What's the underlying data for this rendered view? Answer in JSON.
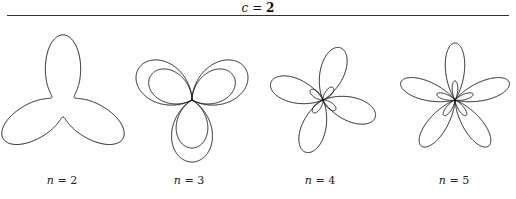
{
  "figure": {
    "header": {
      "var": "c",
      "eq": " = ",
      "value": "2"
    },
    "panels": [
      {
        "n_label": "n",
        "eq": " = ",
        "n": "2",
        "cx": 63,
        "cy": 104,
        "label_x": 62
      },
      {
        "n_label": "n",
        "eq": " = ",
        "n": "3",
        "cx": 192,
        "cy": 100,
        "label_x": 189
      },
      {
        "n_label": "n",
        "eq": " = ",
        "n": "4",
        "cx": 323,
        "cy": 100,
        "label_x": 320
      },
      {
        "n_label": "n",
        "eq": " = ",
        "n": "5",
        "cx": 455,
        "cy": 100,
        "label_x": 454
      }
    ]
  },
  "chart_data": {
    "type": "line",
    "title": "c = 2",
    "series": [
      {
        "name": "n = 2",
        "shape": "three-lobed closed curve (trefoil blob)"
      },
      {
        "name": "n = 3",
        "shape": "three petals with inner nested loops"
      },
      {
        "name": "n = 4",
        "shape": "four petals with small inner loops, rotated"
      },
      {
        "name": "n = 5",
        "shape": "five petals with small inner loops"
      }
    ],
    "grid": false,
    "legend": "none"
  },
  "colors": {
    "stroke": "#1a1a1a",
    "rule": "#333333"
  }
}
